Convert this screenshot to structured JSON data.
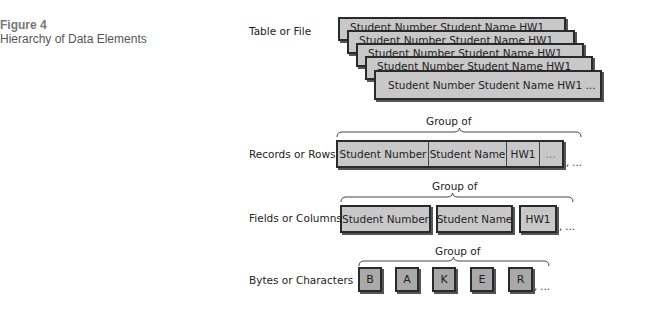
{
  "figure": {
    "number": "Figure 4",
    "title": "Hierarchy of Data Elements"
  },
  "levels": {
    "table": {
      "label": "Table or File",
      "rows": [
        "Student Number  Student Name  HW1",
        "Student Number  Student Name  HW1",
        "Student Number  Student Name  HW1",
        "Student Number  Student Name  HW1",
        "Student Number  Student Name  HW1  ..."
      ]
    },
    "records": {
      "label": "Records or Rows",
      "group_label": "Group of",
      "cells": [
        "Student Number",
        "Student Name",
        "HW1",
        "..."
      ],
      "trailing": ", ..."
    },
    "fields": {
      "label": "Fields or Columns",
      "group_label": "Group of",
      "boxes": [
        "Student Number",
        "Student Name",
        "HW1"
      ],
      "trailing": ", ..."
    },
    "characters": {
      "label": "Bytes or Characters",
      "group_label": "Group of",
      "boxes": [
        "B",
        "A",
        "K",
        "E",
        "R"
      ],
      "trailing": ", ..."
    }
  },
  "colors": {
    "box_fill": "#c8c8c8",
    "char_fill": "#a9a9a9",
    "border": "#2a2a2a"
  }
}
